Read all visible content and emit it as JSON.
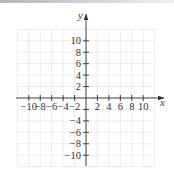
{
  "chart_data": {
    "type": "scatter",
    "title": "",
    "xlabel": "x",
    "ylabel": "y",
    "xlim": [
      -12,
      12
    ],
    "ylim": [
      -12,
      12
    ],
    "grid": true,
    "grid_step": 2,
    "legend": null,
    "x_ticks": [
      -10,
      -8,
      -6,
      -4,
      -2,
      2,
      4,
      6,
      8,
      10
    ],
    "x_tick_labels": [
      "−10",
      "−8",
      "−6",
      "−4",
      "−2",
      "2",
      "4",
      "6",
      "8",
      "10"
    ],
    "y_ticks": [
      10,
      8,
      6,
      4,
      2,
      -2,
      -4,
      -6,
      -8,
      -10
    ],
    "y_tick_labels": [
      "10",
      "8",
      "6",
      "4",
      "2",
      "",
      "−4",
      "−6",
      "−8",
      "−10"
    ],
    "series": []
  },
  "colors": {
    "axis": "#333333",
    "grid": "#e6e6e6",
    "text": "#333333"
  }
}
